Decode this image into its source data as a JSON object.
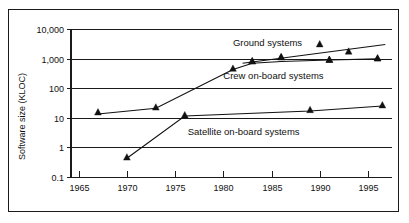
{
  "chart_data": {
    "type": "line",
    "title": "",
    "xlabel": "",
    "ylabel": "Software size (KLOC)",
    "y_scale": "log",
    "ylim": [
      0.1,
      10000
    ],
    "xlim": [
      1964.2,
      1997.5
    ],
    "grid": true,
    "legend_position": "inline-annotations",
    "y_ticks": [
      "10,000",
      "1,000",
      "100",
      "10",
      "1",
      "0.1"
    ],
    "y_tick_values": [
      10000,
      1000,
      100,
      10,
      1,
      0.1
    ],
    "x_ticks": [
      "1965",
      "1970",
      "1975",
      "1980",
      "1985",
      "1990",
      "1995"
    ],
    "x_tick_values": [
      1965,
      1970,
      1975,
      1980,
      1985,
      1990,
      1995
    ],
    "marker": "triangle-up",
    "marker_color": "#111111",
    "line_color": "#111111",
    "series": [
      {
        "name": "Ground systems",
        "label": "Ground systems",
        "label_x": 1981.0,
        "label_y": 2600,
        "x": [
          1983,
          1986,
          1990,
          1991,
          1993,
          1996
        ],
        "y": [
          800,
          1100,
          3000,
          900,
          1700,
          1000
        ],
        "trend": {
          "x": [
            1982.0,
            1996.8
          ],
          "y": [
            700,
            3000
          ]
        }
      },
      {
        "name": "Crew on-board systems",
        "label": "Crew on-board systems",
        "label_x": 1980.0,
        "label_y": 210,
        "x": [
          1967,
          1973,
          1981,
          1983,
          1986,
          1991,
          1996
        ],
        "y": [
          15,
          22,
          450,
          800,
          1100,
          900,
          1000
        ],
        "trend": {
          "x": [
            1967,
            1973,
            1981,
            1983,
            1986,
            1991,
            1996
          ],
          "y": [
            13.5,
            21,
            430,
            700,
            800,
            900,
            980
          ]
        }
      },
      {
        "name": "Satellite on-board systems",
        "label": "Satellite on-board systems",
        "label_x": 1976.3,
        "label_y": 2.6,
        "x": [
          1970,
          1976,
          1989,
          1996.5
        ],
        "y": [
          0.45,
          12,
          18,
          26
        ],
        "trend": {
          "x": [
            1970,
            1976,
            1989,
            1996.5
          ],
          "y": [
            0.43,
            11.5,
            17,
            25
          ]
        }
      }
    ]
  },
  "axes": {
    "y_axis_title": "Software size (KLOC)"
  }
}
